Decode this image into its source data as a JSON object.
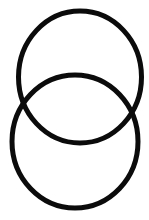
{
  "figure": {
    "background_color": "#ffffff",
    "stroke_color": "#0b0b0b",
    "rings": [
      {
        "id": "top-ring",
        "cx": 80,
        "cy": 77,
        "rx": 61.5,
        "ry": 66,
        "stroke_width": 5
      },
      {
        "id": "bottom-ring",
        "cx": 75,
        "cy": 141.5,
        "rx": 63,
        "ry": 66.5,
        "stroke_width": 5
      }
    ]
  }
}
